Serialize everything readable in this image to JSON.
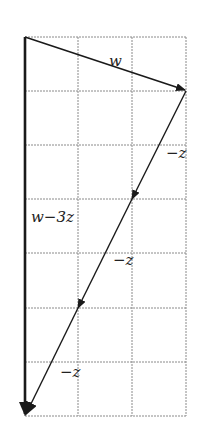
{
  "diagram": {
    "grid": {
      "cols": 3,
      "rows": 7,
      "x0": 25,
      "y0": 37,
      "cell_w": 53.7,
      "cell_h": 54.1,
      "line_color": "#8a8a8a"
    },
    "vectors": [
      {
        "name": "w",
        "from": [
          0,
          0
        ],
        "to": [
          3,
          1
        ],
        "label": "w"
      },
      {
        "name": "minus-z-1",
        "from": [
          3,
          1
        ],
        "to": [
          2,
          3
        ],
        "label": "−z"
      },
      {
        "name": "minus-z-2",
        "from": [
          2,
          3
        ],
        "to": [
          1,
          5
        ],
        "label": "−z"
      },
      {
        "name": "minus-z-3",
        "from": [
          1,
          5
        ],
        "to": [
          0,
          7
        ],
        "label": "−z"
      },
      {
        "name": "w-minus-3z",
        "from": [
          0,
          0
        ],
        "to": [
          0,
          7
        ],
        "label": "w−3z"
      }
    ],
    "labels": {
      "w": "w",
      "neg_z_1": "−z",
      "neg_z_2": "−z",
      "neg_z_3": "−z",
      "w_minus_3z": "w−3z"
    },
    "stroke_color": "#1a1a1a"
  }
}
